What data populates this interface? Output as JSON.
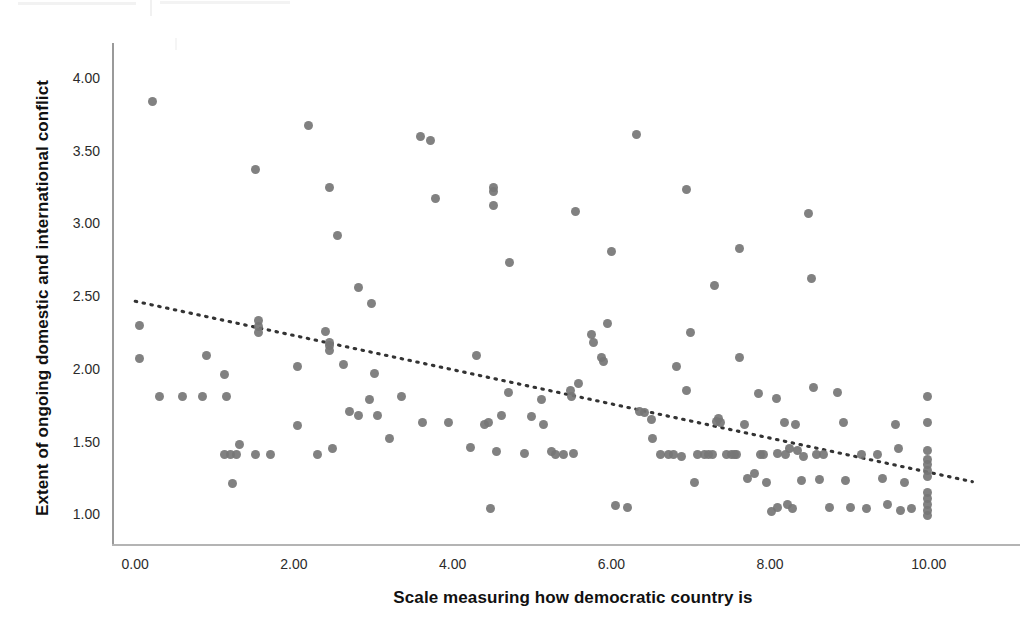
{
  "figure": {
    "background_color": "#ffffff",
    "marker_color": "#767676",
    "axis_color": "#9a9a9a",
    "trendline_color": "#333333"
  },
  "axes": {
    "x_title": "Scale measuring how democratic country is",
    "y_title": "Extent of ongoing domestic and international conflict",
    "x_ticks": [
      "0.00",
      "2.00",
      "4.00",
      "6.00",
      "8.00",
      "10.00"
    ],
    "y_ticks": [
      "4.00",
      "3.50",
      "3.00",
      "2.50",
      "2.00",
      "1.50",
      "1.00"
    ]
  },
  "chart_data": {
    "type": "scatter",
    "title": "",
    "xlabel": "Scale measuring how democratic country is",
    "ylabel": "Extent of ongoing domestic and international conflict",
    "xlim": [
      -0.28,
      11.15
    ],
    "ylim": [
      0.79,
      4.24
    ],
    "xticks": [
      0,
      2,
      4,
      6,
      8,
      10
    ],
    "yticks": [
      1.0,
      1.5,
      2.0,
      2.5,
      3.0,
      3.5,
      4.0
    ],
    "grid": false,
    "legend": null,
    "marker": {
      "shape": "circle",
      "color": "#767676",
      "size_px": 9
    },
    "trendline": {
      "type": "linear-fit",
      "style": "dotted",
      "color": "#333333",
      "x_start": 0.0,
      "y_start": 2.465,
      "x_end": 10.55,
      "y_end": 1.225,
      "slope": -0.1175,
      "intercept": 2.465
    },
    "points": [
      [
        0.22,
        3.84
      ],
      [
        0.05,
        2.3
      ],
      [
        0.05,
        2.07
      ],
      [
        0.3,
        1.81
      ],
      [
        0.6,
        1.81
      ],
      [
        0.85,
        1.81
      ],
      [
        0.9,
        2.09
      ],
      [
        1.15,
        1.81
      ],
      [
        1.12,
        1.96
      ],
      [
        1.12,
        1.41
      ],
      [
        1.2,
        1.41
      ],
      [
        1.28,
        1.41
      ],
      [
        1.22,
        1.21
      ],
      [
        1.32,
        1.48
      ],
      [
        1.52,
        3.37
      ],
      [
        1.55,
        2.29
      ],
      [
        1.55,
        2.25
      ],
      [
        1.55,
        2.33
      ],
      [
        1.52,
        1.41
      ],
      [
        1.7,
        1.41
      ],
      [
        2.05,
        2.02
      ],
      [
        2.05,
        1.61
      ],
      [
        2.18,
        3.67
      ],
      [
        2.3,
        1.41
      ],
      [
        2.4,
        2.26
      ],
      [
        2.45,
        3.25
      ],
      [
        2.45,
        2.16
      ],
      [
        2.45,
        2.18
      ],
      [
        2.45,
        2.13
      ],
      [
        2.48,
        1.45
      ],
      [
        2.55,
        2.92
      ],
      [
        2.62,
        2.03
      ],
      [
        2.7,
        1.71
      ],
      [
        2.82,
        2.56
      ],
      [
        2.82,
        1.68
      ],
      [
        2.95,
        1.79
      ],
      [
        2.98,
        2.45
      ],
      [
        3.02,
        1.97
      ],
      [
        3.05,
        1.68
      ],
      [
        3.2,
        1.52
      ],
      [
        3.35,
        1.81
      ],
      [
        3.6,
        3.6
      ],
      [
        3.62,
        1.63
      ],
      [
        3.72,
        3.57
      ],
      [
        3.78,
        3.17
      ],
      [
        3.95,
        1.63
      ],
      [
        4.22,
        1.46
      ],
      [
        4.3,
        2.09
      ],
      [
        4.4,
        1.62
      ],
      [
        4.45,
        1.63
      ],
      [
        4.48,
        1.04
      ],
      [
        4.52,
        3.22
      ],
      [
        4.52,
        3.25
      ],
      [
        4.52,
        3.12
      ],
      [
        4.55,
        1.43
      ],
      [
        4.62,
        1.68
      ],
      [
        4.7,
        1.84
      ],
      [
        4.72,
        2.73
      ],
      [
        4.9,
        1.42
      ],
      [
        5.0,
        1.67
      ],
      [
        5.12,
        1.79
      ],
      [
        5.15,
        1.62
      ],
      [
        5.25,
        1.43
      ],
      [
        5.3,
        1.41
      ],
      [
        5.4,
        1.41
      ],
      [
        5.48,
        1.85
      ],
      [
        5.5,
        1.81
      ],
      [
        5.52,
        1.42
      ],
      [
        5.55,
        3.08
      ],
      [
        5.58,
        1.9
      ],
      [
        5.75,
        2.24
      ],
      [
        5.78,
        2.18
      ],
      [
        5.88,
        2.08
      ],
      [
        5.9,
        2.05
      ],
      [
        5.95,
        2.31
      ],
      [
        6.0,
        2.81
      ],
      [
        6.05,
        1.06
      ],
      [
        6.2,
        1.05
      ],
      [
        6.32,
        3.61
      ],
      [
        6.35,
        1.71
      ],
      [
        6.42,
        1.7
      ],
      [
        6.5,
        1.65
      ],
      [
        6.52,
        1.52
      ],
      [
        6.62,
        1.41
      ],
      [
        6.72,
        1.41
      ],
      [
        6.78,
        1.41
      ],
      [
        6.82,
        2.02
      ],
      [
        6.88,
        1.4
      ],
      [
        6.95,
        3.23
      ],
      [
        6.95,
        1.85
      ],
      [
        7.0,
        2.25
      ],
      [
        7.05,
        1.22
      ],
      [
        7.08,
        1.41
      ],
      [
        7.18,
        1.41
      ],
      [
        7.22,
        1.41
      ],
      [
        7.28,
        1.41
      ],
      [
        7.3,
        2.57
      ],
      [
        7.32,
        1.64
      ],
      [
        7.35,
        1.66
      ],
      [
        7.38,
        1.63
      ],
      [
        7.45,
        1.41
      ],
      [
        7.52,
        1.41
      ],
      [
        7.55,
        1.41
      ],
      [
        7.58,
        1.41
      ],
      [
        7.62,
        2.83
      ],
      [
        7.62,
        2.08
      ],
      [
        7.68,
        1.62
      ],
      [
        7.72,
        1.25
      ],
      [
        7.8,
        1.28
      ],
      [
        7.85,
        1.83
      ],
      [
        7.88,
        1.41
      ],
      [
        7.92,
        1.41
      ],
      [
        7.95,
        1.22
      ],
      [
        8.02,
        1.02
      ],
      [
        8.08,
        1.8
      ],
      [
        8.1,
        1.42
      ],
      [
        8.1,
        1.05
      ],
      [
        8.18,
        1.63
      ],
      [
        8.2,
        1.41
      ],
      [
        8.22,
        1.07
      ],
      [
        8.25,
        1.45
      ],
      [
        8.28,
        1.04
      ],
      [
        8.32,
        1.62
      ],
      [
        8.35,
        1.44
      ],
      [
        8.4,
        1.23
      ],
      [
        8.42,
        1.4
      ],
      [
        8.48,
        3.07
      ],
      [
        8.52,
        2.62
      ],
      [
        8.55,
        1.87
      ],
      [
        8.58,
        1.41
      ],
      [
        8.62,
        1.24
      ],
      [
        8.68,
        1.41
      ],
      [
        8.75,
        1.05
      ],
      [
        8.85,
        1.84
      ],
      [
        8.92,
        1.63
      ],
      [
        8.95,
        1.23
      ],
      [
        9.02,
        1.05
      ],
      [
        9.15,
        1.41
      ],
      [
        9.22,
        1.04
      ],
      [
        9.35,
        1.41
      ],
      [
        9.42,
        1.25
      ],
      [
        9.48,
        1.07
      ],
      [
        9.58,
        1.62
      ],
      [
        9.62,
        1.45
      ],
      [
        9.65,
        1.03
      ],
      [
        9.7,
        1.22
      ],
      [
        9.78,
        1.04
      ],
      [
        9.98,
        1.81
      ],
      [
        9.98,
        1.63
      ],
      [
        9.98,
        1.44
      ],
      [
        9.98,
        1.38
      ],
      [
        9.98,
        1.34
      ],
      [
        9.98,
        1.3
      ],
      [
        9.98,
        1.26
      ],
      [
        9.98,
        1.15
      ],
      [
        9.98,
        1.11
      ],
      [
        9.98,
        1.07
      ],
      [
        9.98,
        1.03
      ],
      [
        9.98,
        0.99
      ]
    ]
  }
}
